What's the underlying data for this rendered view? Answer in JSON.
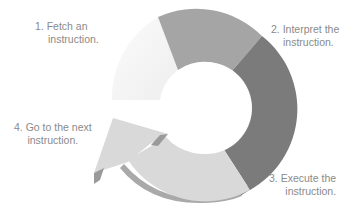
{
  "diagram": {
    "type": "cycle",
    "steps": [
      {
        "number": "1.",
        "line1": "1. Fetch an",
        "line2": "instruction.",
        "color": "#f4f4f4"
      },
      {
        "number": "2.",
        "line1": "2. Interpret the",
        "line2": "instruction.",
        "color": "#a5a5a5"
      },
      {
        "number": "3.",
        "line1": "3. Execute the",
        "line2": "instruction.",
        "color": "#7b7b7b"
      },
      {
        "number": "4.",
        "line1": "4. Go to the next",
        "line2": "instruction.",
        "color": "#d9d9d9"
      }
    ],
    "arrow_shadow_color": "#8c8c8c",
    "label_color": "#8a8a8a"
  }
}
